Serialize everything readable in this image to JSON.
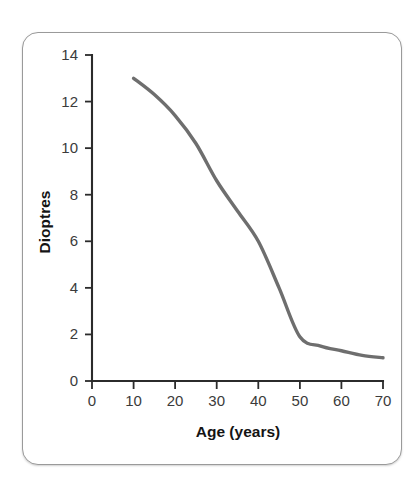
{
  "figure": {
    "kind": "line-chart-figure",
    "frame_style": "rounded-card"
  },
  "chart_data": {
    "type": "line",
    "title": "",
    "subtitle": "",
    "xlabel": "Age (years)",
    "ylabel": "Dioptres",
    "xlim": [
      0,
      70
    ],
    "ylim": [
      0,
      14
    ],
    "grid": false,
    "legend": null,
    "legend_position": "none",
    "x_ticks": [
      0,
      10,
      20,
      30,
      40,
      50,
      60,
      70
    ],
    "x_tick_labels": [
      "0",
      "10",
      "20",
      "30",
      "40",
      "50",
      "60",
      "70"
    ],
    "y_ticks": [
      0,
      2,
      4,
      6,
      8,
      10,
      12,
      14
    ],
    "y_tick_labels": [
      "0",
      "2",
      "4",
      "6",
      "8",
      "10",
      "12",
      "14"
    ],
    "series": [
      {
        "name": "Accommodation amplitude",
        "color": "#6e6e6e",
        "x": [
          10,
          15,
          20,
          25,
          30,
          35,
          40,
          45,
          50,
          55,
          60,
          65,
          70
        ],
        "values": [
          13.0,
          12.3,
          11.4,
          10.2,
          8.6,
          7.3,
          6.0,
          4.0,
          1.9,
          1.5,
          1.3,
          1.1,
          1.0
        ]
      }
    ],
    "annotations": []
  },
  "colors": {
    "curve": "#6e6e6e",
    "axis": "#2b2b2b",
    "tick_label": "#3b3b3b",
    "axis_title": "#141414",
    "card_border": "#9a9a9a",
    "background": "#ffffff"
  },
  "axis_titles": {
    "x": "Age (years)",
    "y": "Dioptres"
  }
}
